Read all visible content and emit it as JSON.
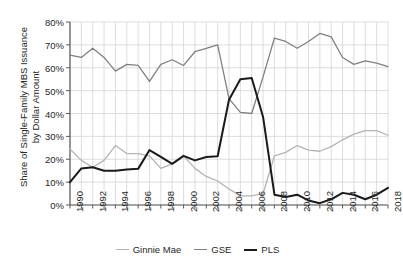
{
  "chart_data": {
    "type": "line",
    "title": "",
    "xlabel": "",
    "ylabel": "Share of Single-Family MBS Issuance\nby Dollar Amount",
    "xlim": [
      1990,
      2018
    ],
    "ylim": [
      0,
      80
    ],
    "y_unit": "%",
    "grid": true,
    "legend_position": "bottom",
    "x": [
      1990,
      1991,
      1992,
      1993,
      1994,
      1995,
      1996,
      1997,
      1998,
      1999,
      2000,
      2001,
      2002,
      2003,
      2004,
      2005,
      2006,
      2007,
      2008,
      2009,
      2010,
      2011,
      2012,
      2013,
      2014,
      2015,
      2016,
      2017,
      2018
    ],
    "xticks": [
      1990,
      1992,
      1994,
      1996,
      1998,
      2000,
      2002,
      2004,
      2006,
      2008,
      2010,
      2012,
      2014,
      2016,
      2018
    ],
    "xticklabels": [
      "1990",
      "1992",
      "1994",
      "1996",
      "1998",
      "2000",
      "2002",
      "2004",
      "2006",
      "2008",
      "2010",
      "2012",
      "2014",
      "2016",
      "2018"
    ],
    "yticks": [
      0,
      10,
      20,
      30,
      40,
      50,
      60,
      70,
      80
    ],
    "yticklabels": [
      "0%",
      "10%",
      "20%",
      "30%",
      "40%",
      "50%",
      "60%",
      "70%",
      "80%"
    ],
    "series": [
      {
        "name": "Ginnie Mae",
        "color": "#b3b3b3",
        "values": [
          24.5,
          19.5,
          16.5,
          19.5,
          26.0,
          22.5,
          22.5,
          21.5,
          16.0,
          18.0,
          21.5,
          16.0,
          12.5,
          10.5,
          7.0,
          4.0,
          4.0,
          5.0,
          21.5,
          23.0,
          26.0,
          24.0,
          23.5,
          25.5,
          28.5,
          31.0,
          32.5,
          32.5,
          30.5
        ]
      },
      {
        "name": "GSE",
        "color": "#808080",
        "values": [
          65.5,
          64.5,
          68.5,
          64.5,
          58.5,
          61.5,
          61.0,
          54.0,
          61.5,
          63.5,
          61.0,
          67.0,
          68.5,
          70.0,
          46.5,
          40.5,
          40.0,
          56.0,
          73.0,
          71.5,
          68.5,
          71.5,
          75.0,
          73.5,
          64.5,
          61.5,
          63.0,
          62.0,
          60.5
        ]
      },
      {
        "name": "PLS",
        "color": "#1a1a1a",
        "values": [
          10.0,
          16.0,
          16.5,
          15.0,
          15.0,
          15.5,
          15.8,
          24.0,
          21.0,
          18.0,
          21.5,
          19.5,
          21.0,
          21.3,
          46.0,
          55.0,
          55.5,
          38.5,
          4.5,
          3.5,
          4.5,
          2.0,
          0.8,
          2.5,
          5.3,
          4.5,
          2.5,
          4.5,
          7.5
        ]
      }
    ]
  },
  "legend": {
    "items": [
      {
        "label": "Ginnie Mae",
        "color": "#b3b3b3"
      },
      {
        "label": "GSE",
        "color": "#808080"
      },
      {
        "label": "PLS",
        "color": "#1a1a1a"
      }
    ]
  }
}
